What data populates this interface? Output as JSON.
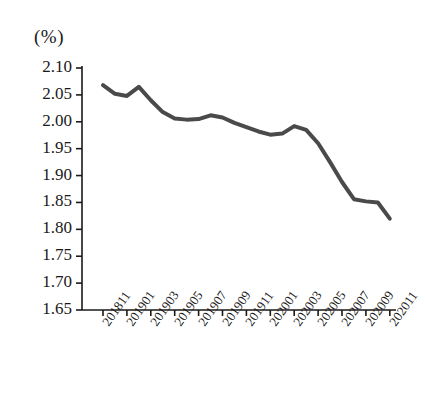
{
  "chart_data": {
    "type": "line",
    "title": "",
    "subtitle": "",
    "unit_label": "(%)",
    "xlabel": "",
    "ylabel": "",
    "ylim": [
      1.65,
      2.1
    ],
    "ytick_step": 0.05,
    "ytick_labels": [
      "2.10",
      "2.05",
      "2.00",
      "1.95",
      "1.90",
      "1.85",
      "1.80",
      "1.75",
      "1.70",
      "1.65"
    ],
    "ytick_values": [
      2.1,
      2.05,
      2.0,
      1.95,
      1.9,
      1.85,
      1.8,
      1.75,
      1.7,
      1.65
    ],
    "xtick_labels": [
      "201811",
      "201901",
      "201903",
      "201905",
      "201907",
      "201909",
      "201911",
      "202001",
      "202003",
      "202005",
      "202007",
      "202009",
      "202011"
    ],
    "grid": false,
    "legend": "none",
    "line_color": "#4a4a4a",
    "line_width": 4,
    "categories": [
      "201811",
      "201812",
      "201901",
      "201902",
      "201903",
      "201904",
      "201905",
      "201906",
      "201907",
      "201908",
      "201909",
      "201910",
      "201911",
      "201912",
      "202001",
      "202002",
      "202003",
      "202004",
      "202005",
      "202006",
      "202007",
      "202008",
      "202009",
      "202010",
      "202011"
    ],
    "series": [
      {
        "name": "rate",
        "values": [
          2.068,
          2.052,
          2.048,
          2.065,
          2.04,
          2.018,
          2.006,
          2.004,
          2.005,
          2.012,
          2.008,
          1.998,
          1.99,
          1.982,
          1.976,
          1.978,
          1.992,
          1.985,
          1.96,
          1.925,
          1.888,
          1.856,
          1.852,
          1.85,
          1.82
        ]
      }
    ]
  }
}
